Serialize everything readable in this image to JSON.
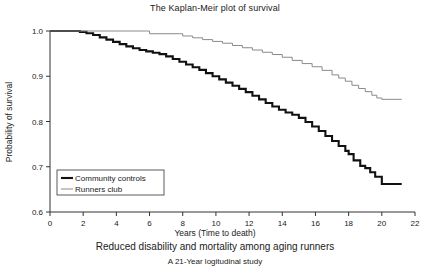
{
  "figure": {
    "title": "The Kaplan-Meir plot of survival",
    "caption_main": "Reduced disability and mortality among aging runners",
    "caption_sub": "A 21-Year logitudinal study"
  },
  "chart_data": {
    "type": "line",
    "title": "The Kaplan-Meir plot of survival",
    "xlabel": "Years (Time to death)",
    "ylabel": "Probability of survival",
    "xlim": [
      0,
      22
    ],
    "ylim": [
      0.6,
      1.0
    ],
    "xticks": [
      0,
      2,
      4,
      6,
      8,
      10,
      12,
      14,
      16,
      18,
      20,
      22
    ],
    "yticks": [
      0.6,
      0.7,
      0.8,
      0.9,
      1.0
    ],
    "xtick_labels": [
      "0",
      "2",
      "4",
      "6",
      "8",
      "10",
      "12",
      "14",
      "16",
      "18",
      "20",
      "22"
    ],
    "ytick_labels": [
      "0.6",
      "0.7",
      "0.8",
      "0.9",
      "1.0"
    ],
    "grid": false,
    "legend_position": "lower left",
    "colors": {
      "controls": "#111111",
      "runners": "#8a8a8a"
    },
    "series": [
      {
        "name": "Community controls",
        "color": "#111111",
        "style": "step",
        "x": [
          0,
          1.0,
          1.8,
          2.2,
          2.6,
          3.0,
          3.4,
          3.8,
          4.2,
          4.6,
          5.0,
          5.4,
          5.8,
          6.2,
          6.6,
          7.0,
          7.4,
          7.8,
          8.2,
          8.6,
          9.0,
          9.4,
          9.8,
          10.2,
          10.6,
          11.0,
          11.4,
          11.8,
          12.2,
          12.6,
          13.0,
          13.4,
          13.8,
          14.2,
          14.6,
          15.0,
          15.4,
          15.8,
          16.2,
          16.6,
          17.0,
          17.4,
          17.8,
          18.0,
          18.3,
          18.7,
          19.0,
          19.3,
          19.6,
          20.0,
          21.2
        ],
        "y": [
          1.0,
          1.0,
          0.998,
          0.995,
          0.991,
          0.986,
          0.981,
          0.976,
          0.971,
          0.966,
          0.962,
          0.958,
          0.955,
          0.952,
          0.949,
          0.944,
          0.938,
          0.932,
          0.926,
          0.92,
          0.914,
          0.907,
          0.9,
          0.893,
          0.886,
          0.879,
          0.872,
          0.865,
          0.857,
          0.849,
          0.841,
          0.833,
          0.826,
          0.82,
          0.815,
          0.808,
          0.799,
          0.789,
          0.779,
          0.768,
          0.757,
          0.746,
          0.735,
          0.728,
          0.714,
          0.702,
          0.697,
          0.688,
          0.678,
          0.662,
          0.662
        ]
      },
      {
        "name": "Runners club",
        "color": "#8a8a8a",
        "style": "step",
        "x": [
          0,
          5.8,
          6.0,
          7.8,
          8.0,
          8.6,
          9.2,
          9.8,
          10.4,
          11.0,
          11.6,
          12.2,
          12.8,
          13.4,
          14.0,
          14.6,
          15.2,
          15.8,
          16.4,
          17.0,
          17.4,
          17.8,
          18.2,
          18.6,
          19.0,
          19.4,
          19.7,
          20.0,
          21.2
        ],
        "y": [
          1.0,
          1.0,
          0.994,
          0.994,
          0.989,
          0.985,
          0.981,
          0.977,
          0.973,
          0.968,
          0.963,
          0.958,
          0.953,
          0.948,
          0.942,
          0.935,
          0.928,
          0.921,
          0.913,
          0.903,
          0.896,
          0.889,
          0.88,
          0.873,
          0.866,
          0.858,
          0.852,
          0.849,
          0.849
        ]
      }
    ],
    "legend": [
      {
        "label": "Community controls",
        "color": "#111111",
        "width": 2.1
      },
      {
        "label": "Runners club",
        "color": "#8a8a8a",
        "width": 1.0
      }
    ]
  }
}
